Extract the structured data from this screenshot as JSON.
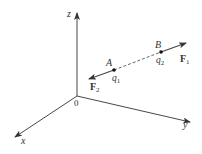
{
  "diagram": {
    "type": "3d-coordinate-force-diagram",
    "colors": {
      "axis": "#333333",
      "force": "#444444",
      "text": "#333333",
      "dashed_line": "#555555"
    },
    "axes": {
      "origin_label": "0",
      "x_label": "x",
      "y_label": "y",
      "z_label": "z"
    },
    "points": [
      {
        "label": "A",
        "charge": "q",
        "charge_sub": "1"
      },
      {
        "label": "B",
        "charge": "q",
        "charge_sub": "2"
      }
    ],
    "forces": [
      {
        "symbol": "F",
        "sub": "1",
        "on": "B"
      },
      {
        "symbol": "F",
        "sub": "2",
        "on": "A"
      }
    ],
    "connector": "dashed line between A and B"
  }
}
